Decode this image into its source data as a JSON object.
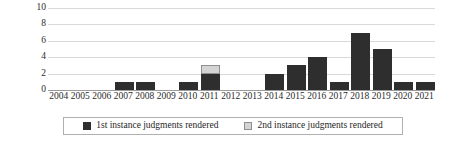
{
  "chart_data": {
    "type": "bar",
    "stacked": true,
    "title": "",
    "xlabel": "",
    "ylabel": "",
    "ylim": [
      0,
      10
    ],
    "yticks": [
      0,
      2,
      4,
      6,
      8,
      10
    ],
    "grid": true,
    "legend_position": "bottom",
    "categories": [
      "2004",
      "2005",
      "2006",
      "2007",
      "2008",
      "2009",
      "2010",
      "2011",
      "2012",
      "2013",
      "2014",
      "2015",
      "2016",
      "2017",
      "2018",
      "2019",
      "2020",
      "2021"
    ],
    "series": [
      {
        "name": "1st instance judgments rendered",
        "color": "#2e2e2e",
        "values": [
          0,
          0,
          0,
          1,
          1,
          0,
          1,
          2,
          0,
          0,
          2,
          3,
          4,
          1,
          7,
          5,
          1,
          1
        ]
      },
      {
        "name": "2nd instance judgments rendered",
        "color": "#d4d4d4",
        "values": [
          0,
          0,
          0,
          0,
          0,
          0,
          0,
          1,
          0,
          0,
          0,
          0,
          0,
          0,
          0,
          0,
          0,
          0
        ]
      }
    ]
  },
  "legend": {
    "items": [
      {
        "label": "1st instance judgments rendered",
        "swatch": "legend-swatch-dark"
      },
      {
        "label": "2nd instance judgments rendered",
        "swatch": "legend-swatch-light"
      }
    ]
  }
}
